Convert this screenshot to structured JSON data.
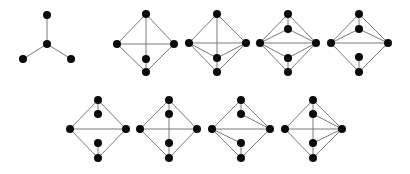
{
  "diagram": {
    "colors": {
      "background": "#ffffff",
      "vertex": "#0a0a0a",
      "edge": "#7a7a7a"
    },
    "vertex_radius": 4,
    "graphs": [
      {
        "id": "g1",
        "nodes": {
          "t": [
            47,
            15
          ],
          "c": [
            47,
            44
          ],
          "l": [
            23,
            59
          ],
          "r": [
            71,
            59
          ]
        },
        "edges": [
          [
            "t",
            "c"
          ],
          [
            "c",
            "l"
          ],
          [
            "c",
            "r"
          ]
        ]
      },
      {
        "id": "g2",
        "nodes": {
          "t": [
            146,
            14
          ],
          "l": [
            117,
            44
          ],
          "r": [
            174,
            44
          ],
          "i": [
            146,
            59
          ],
          "b": [
            146,
            72
          ]
        },
        "edges": [
          [
            "t",
            "l"
          ],
          [
            "t",
            "r"
          ],
          [
            "l",
            "b"
          ],
          [
            "r",
            "b"
          ],
          [
            "l",
            "r"
          ],
          [
            "t",
            "i"
          ],
          [
            "i",
            "b"
          ]
        ]
      },
      {
        "id": "g3",
        "nodes": {
          "t": [
            217,
            14
          ],
          "l": [
            189,
            43
          ],
          "r": [
            246,
            43
          ],
          "i": [
            217,
            58
          ],
          "b": [
            217,
            72
          ]
        },
        "edges": [
          [
            "t",
            "l"
          ],
          [
            "t",
            "r"
          ],
          [
            "l",
            "b"
          ],
          [
            "r",
            "b"
          ],
          [
            "l",
            "r"
          ],
          [
            "t",
            "i"
          ],
          [
            "i",
            "b"
          ],
          [
            "l",
            "i"
          ],
          [
            "r",
            "i"
          ]
        ]
      },
      {
        "id": "g4",
        "nodes": {
          "t": [
            288,
            14
          ],
          "it": [
            288,
            29
          ],
          "l": [
            260,
            43
          ],
          "r": [
            316,
            43
          ],
          "ib": [
            288,
            58
          ],
          "b": [
            288,
            72
          ]
        },
        "edges": [
          [
            "t",
            "l"
          ],
          [
            "t",
            "r"
          ],
          [
            "l",
            "r"
          ],
          [
            "l",
            "b"
          ],
          [
            "r",
            "b"
          ],
          [
            "t",
            "it"
          ],
          [
            "it",
            "l"
          ],
          [
            "it",
            "r"
          ],
          [
            "ib",
            "l"
          ],
          [
            "ib",
            "r"
          ],
          [
            "ib",
            "b"
          ]
        ]
      },
      {
        "id": "g5",
        "nodes": {
          "t": [
            359,
            14
          ],
          "it": [
            359,
            29
          ],
          "l": [
            331,
            43
          ],
          "r": [
            388,
            43
          ],
          "ib": [
            359,
            57
          ],
          "b": [
            359,
            72
          ]
        },
        "edges": [
          [
            "t",
            "l"
          ],
          [
            "t",
            "r"
          ],
          [
            "l",
            "r"
          ],
          [
            "l",
            "b"
          ],
          [
            "r",
            "b"
          ],
          [
            "t",
            "it"
          ],
          [
            "it",
            "l"
          ],
          [
            "it",
            "r"
          ],
          [
            "ib",
            "b"
          ]
        ]
      },
      {
        "id": "g6",
        "nodes": {
          "t": [
            98,
            100
          ],
          "it": [
            98,
            114
          ],
          "l": [
            70,
            129
          ],
          "r": [
            126,
            129
          ],
          "ib": [
            98,
            143
          ],
          "b": [
            98,
            158
          ]
        },
        "edges": [
          [
            "t",
            "l"
          ],
          [
            "t",
            "r"
          ],
          [
            "l",
            "r"
          ],
          [
            "l",
            "b"
          ],
          [
            "r",
            "b"
          ],
          [
            "t",
            "it"
          ],
          [
            "ib",
            "b"
          ]
        ]
      },
      {
        "id": "g7",
        "nodes": {
          "t": [
            169,
            100
          ],
          "it": [
            169,
            114
          ],
          "l": [
            140,
            129
          ],
          "r": [
            197,
            129
          ],
          "ib": [
            169,
            143
          ],
          "b": [
            169,
            158
          ]
        },
        "edges": [
          [
            "t",
            "l"
          ],
          [
            "t",
            "r"
          ],
          [
            "l",
            "r"
          ],
          [
            "l",
            "b"
          ],
          [
            "r",
            "b"
          ],
          [
            "t",
            "it"
          ],
          [
            "it",
            "ib"
          ],
          [
            "ib",
            "b"
          ]
        ]
      },
      {
        "id": "g8",
        "nodes": {
          "t": [
            241,
            100
          ],
          "it": [
            241,
            114
          ],
          "l": [
            212,
            129
          ],
          "r": [
            270,
            129
          ],
          "ib": [
            241,
            143
          ],
          "b": [
            241,
            158
          ]
        },
        "edges": [
          [
            "t",
            "l"
          ],
          [
            "t",
            "r"
          ],
          [
            "l",
            "r"
          ],
          [
            "l",
            "b"
          ],
          [
            "r",
            "b"
          ],
          [
            "t",
            "it"
          ],
          [
            "it",
            "r"
          ],
          [
            "l",
            "ib"
          ],
          [
            "ib",
            "b"
          ]
        ]
      },
      {
        "id": "g9",
        "nodes": {
          "t": [
            313,
            100
          ],
          "it": [
            313,
            114
          ],
          "l": [
            285,
            129
          ],
          "r": [
            342,
            129
          ],
          "ib": [
            313,
            143
          ],
          "b": [
            313,
            158
          ]
        },
        "edges": [
          [
            "t",
            "l"
          ],
          [
            "t",
            "r"
          ],
          [
            "l",
            "r"
          ],
          [
            "l",
            "b"
          ],
          [
            "r",
            "b"
          ],
          [
            "t",
            "it"
          ],
          [
            "it",
            "ib"
          ],
          [
            "ib",
            "b"
          ],
          [
            "it",
            "r"
          ],
          [
            "ib",
            "r"
          ]
        ]
      }
    ]
  }
}
